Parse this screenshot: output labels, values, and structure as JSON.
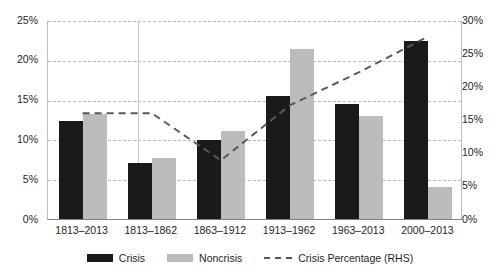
{
  "chart_data": {
    "type": "bar",
    "title": "",
    "xlabel": "",
    "ylabel": "",
    "categories": [
      "1813–2013",
      "1813–1862",
      "1863–1912",
      "1913–1962",
      "1963–2013",
      "2000–2013"
    ],
    "series": [
      {
        "name": "Crisis",
        "type": "bar",
        "color": "#1a1a1a",
        "axis": "left",
        "values": [
          12.3,
          7.0,
          9.9,
          15.4,
          14.4,
          22.4
        ]
      },
      {
        "name": "Noncrisis",
        "type": "bar",
        "color": "#bcbcbc",
        "axis": "left",
        "values": [
          13.2,
          7.7,
          11.0,
          21.3,
          13.0,
          4.0
        ]
      },
      {
        "name": "Crisis Percentage (RHS)",
        "type": "line",
        "color": "#58595b",
        "axis": "right",
        "style": "dashed",
        "values": [
          16.1,
          16.1,
          9.0,
          17.3,
          22.3,
          27.7
        ]
      }
    ],
    "ylim": [
      0,
      25
    ],
    "y_ticks_left": [
      "0%",
      "5%",
      "10%",
      "15%",
      "20%",
      "25%"
    ],
    "ylim_right": [
      0,
      30
    ],
    "y_ticks_right": [
      "0%",
      "5%",
      "10%",
      "15%",
      "20%",
      "25%",
      "30%"
    ],
    "grid": true,
    "legend_position": "bottom",
    "legend": [
      "Crisis",
      "Noncrisis",
      "Crisis Percentage (RHS)"
    ]
  },
  "axes": {
    "left_ticks": [
      {
        "label": "25%",
        "value": 25
      },
      {
        "label": "20%",
        "value": 20
      },
      {
        "label": "15%",
        "value": 15
      },
      {
        "label": "10%",
        "value": 10
      },
      {
        "label": "5%",
        "value": 5
      },
      {
        "label": "0%",
        "value": 0
      }
    ],
    "right_ticks": [
      {
        "label": "30%",
        "value": 30
      },
      {
        "label": "25%",
        "value": 25
      },
      {
        "label": "20%",
        "value": 20
      },
      {
        "label": "15%",
        "value": 15
      },
      {
        "label": "10%",
        "value": 10
      },
      {
        "label": "5%",
        "value": 5
      },
      {
        "label": "0%",
        "value": 0
      }
    ]
  },
  "legend": {
    "crisis": "Crisis",
    "noncrisis": "Noncrisis",
    "crisis_percentage": "Crisis Percentage (RHS)"
  },
  "colors": {
    "crisis": "#1a1a1a",
    "noncrisis": "#bcbcbc",
    "line": "#58595b",
    "grid": "#b9bbbd",
    "axis": "#808285"
  }
}
